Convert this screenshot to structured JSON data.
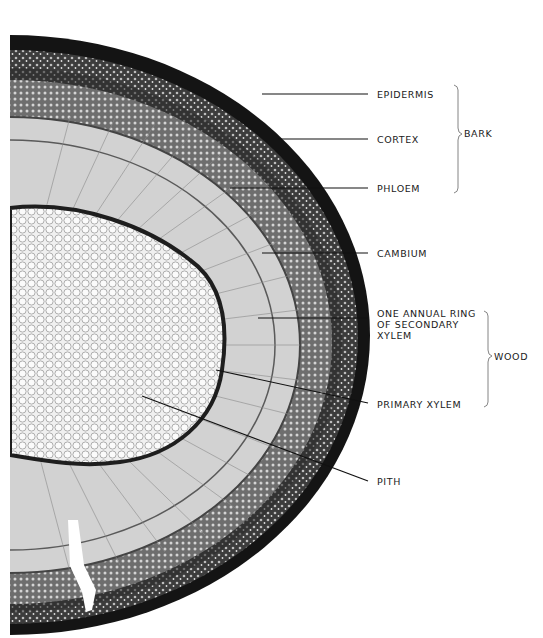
{
  "figure": {
    "labels": {
      "epidermis": "EPIDERMIS",
      "cortex": "CORTEX",
      "phloem": "PHLOEM",
      "cambium": "CAMBIUM",
      "annual_ring": "ONE ANNUAL RING\nOF SECONDARY\nXYLEM",
      "primary_xylem": "PRIMARY XYLEM",
      "pith": "PITH"
    },
    "groups": {
      "bark": "BARK",
      "wood": "WOOD"
    },
    "colors": {
      "background": "#ffffff",
      "bark_dark": "#141414",
      "cortex_gray": "#5a5a5a",
      "wood_light": "#c9c9c9",
      "pith_light": "#ececec",
      "ink": "#1a1a1a"
    }
  }
}
